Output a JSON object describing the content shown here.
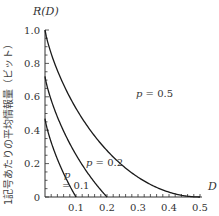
{
  "chart_data": {
    "type": "line",
    "title": "",
    "xlabel": "D",
    "ylabel": "R(D)",
    "ylabel_side": "1記号あたりの平均情報量（ビット）",
    "xlim": [
      0,
      0.5
    ],
    "ylim": [
      0,
      1.0
    ],
    "xticks": [
      0.1,
      0.2,
      0.3,
      0.4,
      0.5
    ],
    "xtick_labels": [
      "0.1",
      "0.2",
      "0.3",
      "0.4",
      "0.5"
    ],
    "yticks": [
      0,
      0.2,
      0.4,
      0.6,
      0.8,
      1.0
    ],
    "ytick_labels": [
      "0",
      "0.2",
      "0.4",
      "0.6",
      "0.8",
      "1.0"
    ],
    "grid": false,
    "legend": "inline labels",
    "series": [
      {
        "name": "p=0.5",
        "label": "p=0.5",
        "p": 0.5,
        "x": [
          0,
          0.05,
          0.1,
          0.15,
          0.2,
          0.25,
          0.3,
          0.35,
          0.4,
          0.45,
          0.5
        ],
        "values": [
          1.0,
          0.714,
          0.531,
          0.39,
          0.278,
          0.189,
          0.119,
          0.066,
          0.029,
          0.007,
          0.0
        ]
      },
      {
        "name": "p=0.2",
        "label": "p=0.2",
        "p": 0.2,
        "x": [
          0,
          0.025,
          0.05,
          0.075,
          0.1,
          0.125,
          0.15,
          0.175,
          0.2
        ],
        "values": [
          0.722,
          0.553,
          0.436,
          0.338,
          0.253,
          0.178,
          0.112,
          0.053,
          0.0
        ]
      },
      {
        "name": "p=0.1",
        "label": "p=0.1",
        "p": 0.1,
        "x": [
          0,
          0.0125,
          0.025,
          0.0375,
          0.05,
          0.0625,
          0.075,
          0.0875,
          0.1
        ],
        "values": [
          0.469,
          0.372,
          0.3,
          0.238,
          0.183,
          0.132,
          0.085,
          0.041,
          0.0
        ]
      }
    ]
  },
  "labels": {
    "y_title": "R(D)",
    "x_title": "D",
    "side_label": "1記号あたりの平均情報量（ビット）",
    "curve_p05": "p = 0.5",
    "curve_p02": "p = 0.2",
    "curve_p01_p": "p",
    "curve_p01_val": "= 0.1"
  }
}
